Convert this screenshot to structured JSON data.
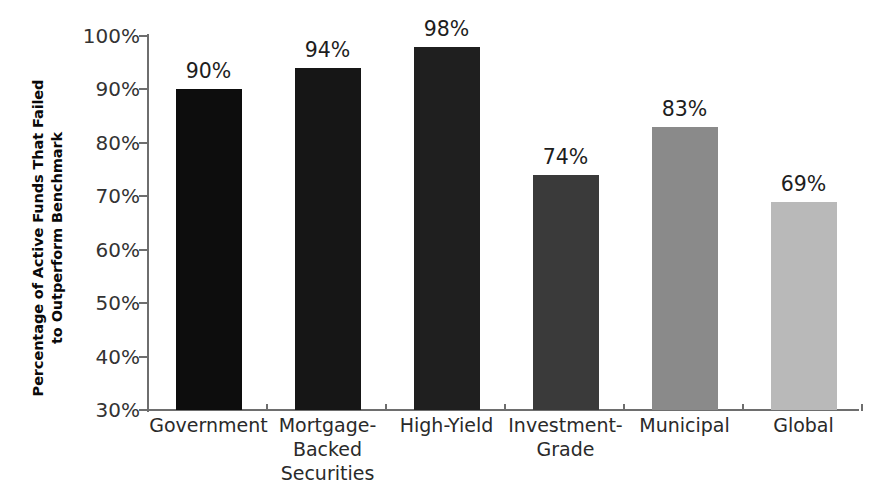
{
  "chart_data": {
    "type": "bar",
    "title": "",
    "xlabel": "",
    "ylabel": "Percentage of Active Funds That Failed to Outperform Benchmark",
    "ylabel_lines": [
      "Percentage of Active Funds That Failed",
      "to Outperform Benchmark"
    ],
    "categories": [
      "Government",
      "Mortgage-Backed Securities",
      "High-Yield",
      "Investment-Grade",
      "Municipal",
      "Global"
    ],
    "category_label_lines": [
      [
        "Government"
      ],
      [
        "Mortgage-",
        "Backed",
        "Securities"
      ],
      [
        "High-Yield"
      ],
      [
        "Investment-",
        "Grade"
      ],
      [
        "Municipal"
      ],
      [
        "Global"
      ]
    ],
    "values": [
      90,
      94,
      98,
      74,
      83,
      69
    ],
    "value_labels": [
      "90%",
      "94%",
      "98%",
      "74%",
      "83%",
      "69%"
    ],
    "bar_colors": [
      "#0d0d0d",
      "#161616",
      "#1f1f1f",
      "#3a3a3a",
      "#8a8a8a",
      "#b9b9b9"
    ],
    "ylim": [
      30,
      100
    ],
    "ytick_values": [
      100,
      90,
      80,
      70,
      60,
      50,
      40,
      30
    ],
    "ytick_labels": [
      "100%",
      "90%",
      "80%",
      "70%",
      "60%",
      "50%",
      "40%",
      "30%"
    ],
    "grid": false,
    "legend": "none",
    "axis_color": "#6e6e6e",
    "background_color": "#ffffff"
  }
}
